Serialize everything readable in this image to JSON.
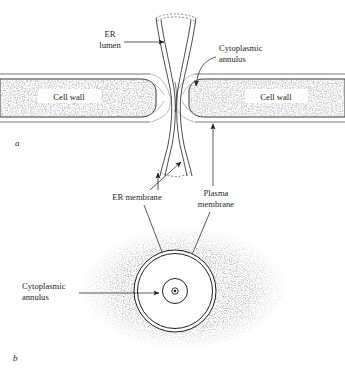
{
  "figure": {
    "title_visible": false,
    "panels": [
      {
        "id": "a",
        "label": "a",
        "caption": "longitudinal section of plasmodesma"
      },
      {
        "id": "b",
        "label": "b",
        "caption": "cross section of plasmodesma"
      }
    ],
    "labels": {
      "er_lumen_line1": "ER",
      "er_lumen_line2": "lumen",
      "cytoplasmic_annulus_line1": "Cytoplasmic",
      "cytoplasmic_annulus_line2": "annulus",
      "cell_wall_left": "Cell wall",
      "cell_wall_right": "Cell wall",
      "er_membrane": "ER membrane",
      "plasma_membrane_line1": "Plasma",
      "plasma_membrane_line2": "membrane",
      "cytoplasmic_annulus_b_line1": "Cytoplasmic",
      "cytoplasmic_annulus_b_line2": "annulus"
    },
    "colors": {
      "ink": "#231f20",
      "background": "#ffffff",
      "stipple": "#6b6b6b",
      "faint_line": "#9a9a9a"
    }
  }
}
